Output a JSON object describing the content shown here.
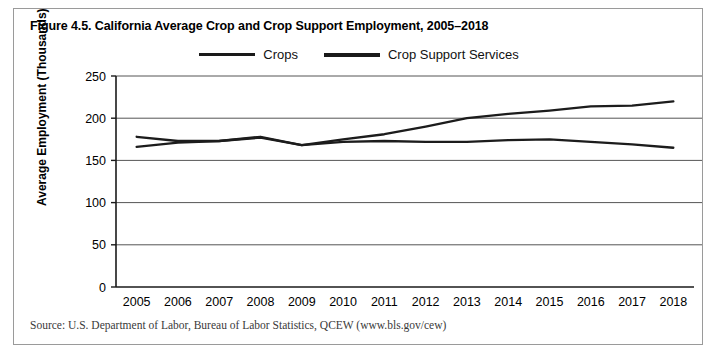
{
  "figure": {
    "title": "Figure 4.5. California Average Crop and Crop Support Employment, 2005–2018",
    "source": "Source: U.S. Department of Labor, Bureau of Labor Statistics, QCEW (www.bls.gov/cew)"
  },
  "chart_data": {
    "type": "line",
    "title": "Figure 4.5. California Average Crop and Crop Support Employment, 2005–2018",
    "xlabel": "",
    "ylabel": "Average Employment (Thousands)",
    "categories": [
      "2005",
      "2006",
      "2007",
      "2008",
      "2009",
      "2010",
      "2011",
      "2012",
      "2013",
      "2014",
      "2015",
      "2016",
      "2017",
      "2018"
    ],
    "x": [
      2005,
      2006,
      2007,
      2008,
      2009,
      2010,
      2011,
      2012,
      2013,
      2014,
      2015,
      2016,
      2017,
      2018
    ],
    "series": [
      {
        "name": "Crops",
        "values": [
          166,
          171,
          173,
          177,
          168,
          175,
          181,
          190,
          200,
          205,
          209,
          214,
          215,
          220
        ]
      },
      {
        "name": "Crop Support Services",
        "values": [
          178,
          173,
          173,
          178,
          168,
          172,
          173,
          172,
          172,
          174,
          175,
          172,
          169,
          165
        ]
      }
    ],
    "ylim": [
      0,
      250
    ],
    "yticks": [
      0,
      50,
      100,
      150,
      200,
      250
    ],
    "ytick_labels": [
      "0",
      "50",
      "100",
      "150",
      "200",
      "250"
    ],
    "grid": true,
    "legend_position": "top-center",
    "legend": [
      "Crops",
      "Crop Support Services"
    ],
    "colors": {
      "crops": "#1c1c1c",
      "crop_support_services": "#1c1c1c",
      "gridline": "#555555",
      "axis": "#1a1a1a",
      "border": "#9a9a9a"
    }
  }
}
